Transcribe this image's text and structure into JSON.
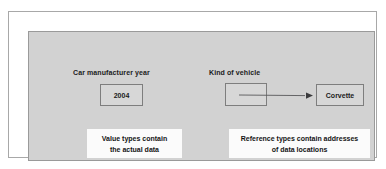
{
  "diagram": {
    "value_type": {
      "label": "Car manufacturer year",
      "cell_value": "2004",
      "caption_line1": "Value types contain",
      "caption_line2": "the actual data"
    },
    "reference_type": {
      "label": "Kind of vehicle",
      "cell_value": "",
      "target_value": "Corvette",
      "caption_line1": "Reference types contain addresses",
      "caption_line2": "of data locations"
    },
    "colors": {
      "panel": "#d2d2d2",
      "panel_border": "#9a9a9a",
      "outer_border": "#a8a8a8",
      "box_fill": "#d7d7d7",
      "box_border": "#7e7e7e",
      "caption_fill": "#fbfbfb",
      "arrow": "#58585a",
      "text": "#1b1b1b"
    }
  }
}
